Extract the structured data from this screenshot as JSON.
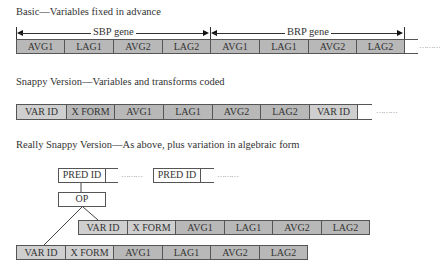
{
  "basic": {
    "title": "Basic—Variables fixed in advance",
    "genes": [
      {
        "label": "SBP gene",
        "cells": [
          "AVG1",
          "LAG1",
          "AVG2",
          "LAG2"
        ]
      },
      {
        "label": "BRP gene",
        "cells": [
          "AVG1",
          "LAG1",
          "AVG2",
          "LAG2"
        ]
      }
    ],
    "continuation": "………"
  },
  "snappy": {
    "title": "Snappy Version—Variables and transforms coded",
    "cells": [
      "VAR ID",
      "X FORM",
      "AVG1",
      "LAG1",
      "AVG2",
      "LAG2",
      "VAR ID"
    ],
    "continuation": "………"
  },
  "really_snappy": {
    "title": "Really Snappy Version—As above, plus variation in algebraic form",
    "pred_boxes": [
      "PRED ID",
      "PRED ID"
    ],
    "continuation": "………",
    "op_label": "OP",
    "upper_row": [
      "VAR ID",
      "X FORM",
      "AVG1",
      "LAG1",
      "AVG2",
      "LAG2"
    ],
    "lower_row": [
      "VAR ID",
      "X FORM",
      "AVG1",
      "LAG1",
      "AVG2",
      "LAG2"
    ]
  },
  "colors": {
    "light_cell": "#cfcfcf",
    "dark_cell": "#b8b8b8",
    "border": "#555555"
  }
}
